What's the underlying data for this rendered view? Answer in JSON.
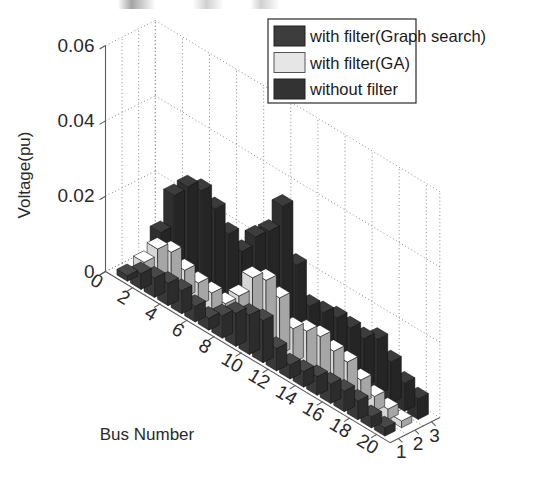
{
  "chart_data": {
    "type": "bar",
    "subtype": "bar3-grouped-3d",
    "title": "",
    "xlabel": "Bus Number",
    "ylabel": "Voltage(pu)",
    "zlabel": "",
    "ylim": [
      0,
      0.06
    ],
    "yticks": [
      "0",
      "0.02",
      "0.04",
      "0.06"
    ],
    "ytick_values": [
      0,
      0.02,
      0.04,
      0.06
    ],
    "xticks": [
      "0",
      "2",
      "4",
      "6",
      "8",
      "10",
      "12",
      "14",
      "16",
      "18",
      "20"
    ],
    "xtick_values": [
      0,
      2,
      4,
      6,
      8,
      10,
      12,
      14,
      16,
      18,
      20
    ],
    "xlim": [
      0,
      21
    ],
    "zticks": [
      "1",
      "2",
      "3"
    ],
    "ztick_values": [
      1,
      2,
      3
    ],
    "grid": true,
    "legend_position": "top-right",
    "categories": [
      1,
      2,
      3,
      4,
      5,
      6,
      7,
      8,
      9,
      10,
      11,
      12,
      13,
      14,
      15,
      16,
      17,
      18,
      19,
      20
    ],
    "series": [
      {
        "name": "with filter(Graph search)",
        "row": 1,
        "color": "#3d3d3d",
        "values": [
          0.0015,
          0.0042,
          0.0052,
          0.006,
          0.0062,
          0.0042,
          0.0032,
          0.006,
          0.0088,
          0.0105,
          0.0112,
          0.006,
          0.0038,
          0.0042,
          0.005,
          0.0052,
          0.0055,
          0.005,
          0.003,
          0.0022
        ]
      },
      {
        "name": "with filter(GA)",
        "row": 2,
        "color": "#e6e6e6",
        "values": [
          0.0028,
          0.0085,
          0.0098,
          0.0072,
          0.006,
          0.0055,
          0.0048,
          0.009,
          0.016,
          0.0175,
          0.015,
          0.009,
          0.0105,
          0.0112,
          0.0095,
          0.0088,
          0.0062,
          0.004,
          0.0028,
          0.0018
        ]
      },
      {
        "name": "without filter",
        "row": 3,
        "color": "#333333",
        "values": [
          0.0085,
          0.0205,
          0.025,
          0.0262,
          0.0235,
          0.019,
          0.0165,
          0.0225,
          0.0262,
          0.035,
          0.0215,
          0.0128,
          0.0132,
          0.014,
          0.0135,
          0.0128,
          0.0148,
          0.011,
          0.0075,
          0.0055
        ]
      }
    ]
  },
  "legend": {
    "items": [
      {
        "label": "with filter(Graph search)",
        "color": "#3d3d3d"
      },
      {
        "label": "with filter(GA)",
        "color": "#e6e6e6"
      },
      {
        "label": "without filter",
        "color": "#333333"
      }
    ]
  },
  "axes": {
    "ylabel": "Voltage(pu)",
    "xlabel": "Bus Number"
  }
}
